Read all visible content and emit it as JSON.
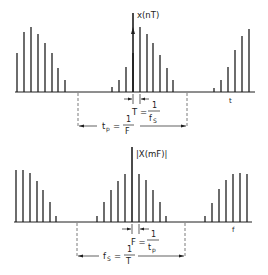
{
  "colors": {
    "ink": "#1e1e1e",
    "background": "#ffffff"
  },
  "top": {
    "axis_label": "x(nT)",
    "axis_label_name": "x(nT)",
    "t_label": "t",
    "T_eq": "T =",
    "T_num": "1",
    "T_den": "f",
    "T_den_sub": "S",
    "tp_eq_left": "t",
    "tp_eq_left_sub": "p",
    "tp_eq": "=",
    "tp_num": "1",
    "tp_den": "F"
  },
  "bottom": {
    "axis_label": "|X(mF)|",
    "f_label": "f",
    "F_eq": "F =",
    "F_num": "1",
    "F_den": "t",
    "F_den_sub": "p",
    "fs_eq_left": "f",
    "fs_eq_left_sub": "S",
    "fs_eq": "=",
    "fs_num": "1",
    "fs_den": "T"
  },
  "chart_data": [
    {
      "type": "bar",
      "title": "Sampled periodic time signal x(nT)",
      "xlabel": "t",
      "ylabel": "x(nT)",
      "annotations": [
        "T = 1/fS",
        "tp = 1/F"
      ],
      "baseline_y": 92,
      "bars": [
        {
          "x": 17,
          "top": 53
        },
        {
          "x": 24,
          "top": 32
        },
        {
          "x": 31,
          "top": 27
        },
        {
          "x": 38,
          "top": 34
        },
        {
          "x": 45,
          "top": 43
        },
        {
          "x": 52,
          "top": 53
        },
        {
          "x": 58,
          "top": 68
        },
        {
          "x": 65,
          "top": 80
        },
        {
          "x": 112,
          "top": 87
        },
        {
          "x": 119,
          "top": 80
        },
        {
          "x": 126,
          "top": 67
        },
        {
          "x": 133,
          "top": 53
        },
        {
          "x": 140,
          "top": 27
        },
        {
          "x": 147,
          "top": 34
        },
        {
          "x": 153,
          "top": 43
        },
        {
          "x": 160,
          "top": 55
        },
        {
          "x": 167,
          "top": 68
        },
        {
          "x": 173,
          "top": 80
        },
        {
          "x": 214,
          "top": 88
        },
        {
          "x": 221,
          "top": 80
        },
        {
          "x": 228,
          "top": 67
        },
        {
          "x": 235,
          "top": 50
        },
        {
          "x": 242,
          "top": 36
        },
        {
          "x": 249,
          "top": 29
        }
      ],
      "axis_x": 133,
      "dashed_x": [
        78,
        187
      ]
    },
    {
      "type": "bar",
      "title": "Sampled periodic spectrum |X(mF)|",
      "xlabel": "f",
      "ylabel": "|X(mF)|",
      "annotations": [
        "F = 1/tp",
        "fS = 1/T"
      ],
      "baseline_y": 222,
      "bars": [
        {
          "x": 16,
          "top": 170
        },
        {
          "x": 23,
          "top": 170
        },
        {
          "x": 30,
          "top": 173
        },
        {
          "x": 37,
          "top": 181
        },
        {
          "x": 43,
          "top": 190
        },
        {
          "x": 50,
          "top": 202
        },
        {
          "x": 56,
          "top": 216
        },
        {
          "x": 97,
          "top": 216
        },
        {
          "x": 104,
          "top": 202
        },
        {
          "x": 111,
          "top": 190
        },
        {
          "x": 118,
          "top": 181
        },
        {
          "x": 125,
          "top": 174
        },
        {
          "x": 132,
          "top": 147
        },
        {
          "x": 139,
          "top": 174
        },
        {
          "x": 146,
          "top": 180
        },
        {
          "x": 153,
          "top": 190
        },
        {
          "x": 160,
          "top": 202
        },
        {
          "x": 166,
          "top": 216
        },
        {
          "x": 205,
          "top": 216
        },
        {
          "x": 212,
          "top": 203
        },
        {
          "x": 219,
          "top": 189
        },
        {
          "x": 226,
          "top": 180
        },
        {
          "x": 233,
          "top": 174
        },
        {
          "x": 240,
          "top": 173
        },
        {
          "x": 247,
          "top": 174
        }
      ],
      "axis_x": 132,
      "dashed_x": [
        77,
        185
      ]
    }
  ]
}
